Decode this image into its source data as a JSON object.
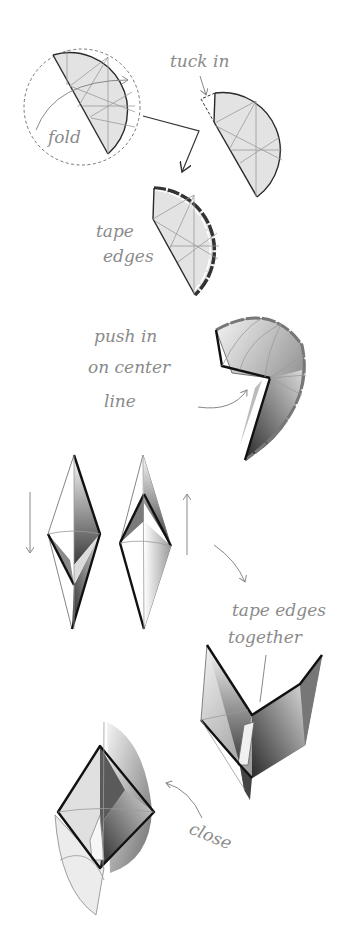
{
  "diagram": {
    "type": "paper-folding instructions",
    "steps": [
      {
        "id": 1,
        "label": "fold",
        "description": "Circle with crease pattern folded along a chord"
      },
      {
        "id": 2,
        "label": "tuck in",
        "description": "Folded half-disc with dashed flap tucked in"
      },
      {
        "id": 3,
        "label_line1": "tape",
        "label_line2": "edges",
        "description": "Half-disc with taped curved edge"
      },
      {
        "id": 4,
        "label_line1": "push in",
        "label_line2": "on center",
        "label_line3": "line",
        "description": "3D curved form pushed in along center crease"
      },
      {
        "id": 5,
        "description": "Two diamond-shaped forms with down and up arrows"
      },
      {
        "id": 6,
        "label_line1": "tape edges",
        "label_line2": "together",
        "description": "Joined forms with edges taped together"
      },
      {
        "id": 7,
        "label": "close",
        "description": "Closed final 3D form"
      }
    ]
  },
  "colors": {
    "background": "#ffffff",
    "paper_fill": "#e3e3e3",
    "crease_lines": "#9a9a9a",
    "outline": "#2a2a2a",
    "handwriting": "#8a8a8a"
  }
}
